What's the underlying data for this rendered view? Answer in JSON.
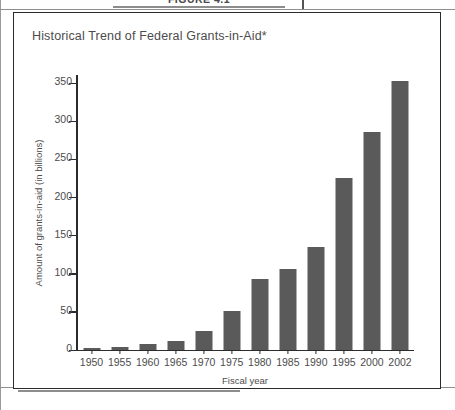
{
  "page": {
    "figure_caption": "FIGURE 4.1"
  },
  "figure": {
    "title": "Historical Trend of Federal Grants-in-Aid*"
  },
  "chart_data": {
    "type": "bar",
    "title": "Historical Trend of Federal Grants-in-Aid*",
    "xlabel": "Fiscal year",
    "ylabel": "Amount of grants-in-aid (in billions)",
    "categories": [
      "1950",
      "1955",
      "1960",
      "1965",
      "1970",
      "1975",
      "1980",
      "1985",
      "1990",
      "1995",
      "2000",
      "2002"
    ],
    "values": [
      2,
      3,
      7,
      11,
      24,
      51,
      92,
      106,
      135,
      225,
      285,
      352
    ],
    "ylim": [
      0,
      360
    ],
    "yticks": [
      0,
      50,
      100,
      150,
      200,
      250,
      300,
      350
    ],
    "ytick_labels": [
      "0",
      "50",
      "100",
      "150",
      "200",
      "250",
      "300",
      "350"
    ],
    "grid": false,
    "legend": null,
    "bar_color": "#5a5a5a",
    "axis_color": "#2b2b2b"
  }
}
